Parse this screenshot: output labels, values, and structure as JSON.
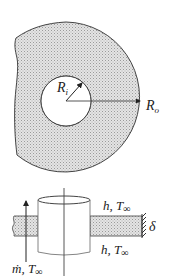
{
  "diagram": {
    "type": "annular fin geometry",
    "top_view": {
      "inner_radius_label": "R",
      "inner_radius_sub": "i",
      "outer_radius_label": "R",
      "outer_radius_sub": "o"
    },
    "side_view": {
      "top_convection_label": "h, T",
      "top_convection_sub": "∞",
      "bottom_convection_label": "h, T",
      "bottom_convection_sub": "∞",
      "thickness_label": "δ",
      "flow_label": "ṁ, T",
      "flow_sub": "∞"
    }
  },
  "colors": {
    "stroke": "#444444",
    "hatch_fill": "#d9d9d9",
    "hatch_dot": "#9a9a9a",
    "background": "#ffffff"
  }
}
